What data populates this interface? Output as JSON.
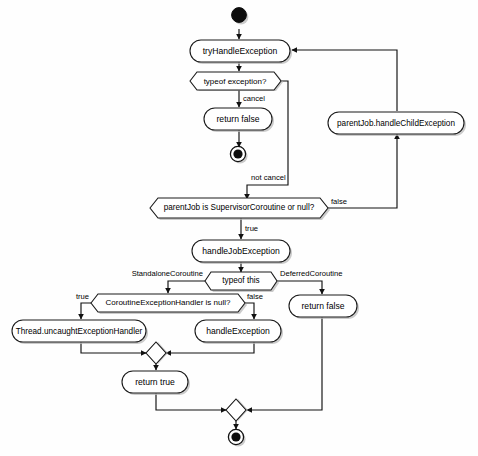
{
  "diagram": {
    "type": "uml-activity-diagram",
    "background_color": "#fefefe",
    "stroke_color": "#111111",
    "node_fill_color": "#ffffff",
    "shadow_color": "#b9b9b9",
    "nodes": {
      "start": {
        "kind": "initial-node",
        "label": ""
      },
      "try_handle_exception": {
        "kind": "action",
        "label": "tryHandleException"
      },
      "typeof_exception": {
        "kind": "decision",
        "label": "typeof exception?"
      },
      "return_false_cancel": {
        "kind": "action",
        "label": "return false"
      },
      "end_cancel": {
        "kind": "final-node",
        "label": ""
      },
      "parent_job_supervisor": {
        "kind": "decision",
        "label": "parentJob is SupervisorCoroutine or null?"
      },
      "parent_job_handle_child": {
        "kind": "action",
        "label": "parentJob.handleChildException"
      },
      "handle_job_exception": {
        "kind": "action",
        "label": "handleJobException"
      },
      "typeof_this": {
        "kind": "decision",
        "label": "typeof this"
      },
      "ceh_is_null": {
        "kind": "decision",
        "label": "CoroutineExceptionHandler is null?"
      },
      "thread_uncaught": {
        "kind": "action",
        "label": "Thread.uncaughtExceptionHandler"
      },
      "handle_exception": {
        "kind": "action",
        "label": "handleException"
      },
      "return_false_deferred": {
        "kind": "action",
        "label": "return false"
      },
      "merge_upper": {
        "kind": "merge-node",
        "label": ""
      },
      "return_true": {
        "kind": "action",
        "label": "return true"
      },
      "merge_lower": {
        "kind": "merge-node",
        "label": ""
      },
      "end_final": {
        "kind": "final-node",
        "label": ""
      }
    },
    "edge_labels": {
      "cancel": "cancel",
      "not_cancel": "not cancel",
      "supervisor_true": "true",
      "supervisor_false": "false",
      "standalone_coroutine": "StandaloneCoroutine",
      "deferred_coroutine": "DeferredCoroutine",
      "ceh_true": "true",
      "ceh_false": "false"
    }
  }
}
